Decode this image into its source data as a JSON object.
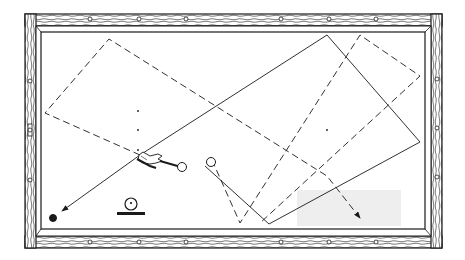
{
  "diagram": {
    "colors": {
      "ink": "#1a1a1a",
      "felt": "#ffffff",
      "rail_wood": "#ffffff",
      "shade": "#eeeeee"
    },
    "table": {
      "outer": {
        "x": 25,
        "y": 14,
        "w": 417,
        "h": 234
      },
      "inner": {
        "x": 41,
        "y": 32,
        "w": 384,
        "h": 197
      }
    },
    "rail_diamonds": {
      "top": [
        [
          90,
          19
        ],
        [
          139,
          19
        ],
        [
          186,
          19
        ],
        [
          281,
          19
        ],
        [
          329,
          19
        ],
        [
          376,
          19
        ]
      ],
      "bottom": [
        [
          90,
          242
        ],
        [
          139,
          242
        ],
        [
          186,
          242
        ],
        [
          281,
          242
        ],
        [
          329,
          242
        ],
        [
          376,
          242
        ]
      ],
      "left": [
        [
          30,
          81
        ],
        [
          30,
          130
        ],
        [
          30,
          180
        ]
      ],
      "right": [
        [
          437,
          79
        ],
        [
          437,
          128
        ],
        [
          437,
          177
        ]
      ]
    },
    "paths": [
      {
        "name": "dashed-path-1",
        "style": "dashed",
        "points": [
          [
            140,
            155
          ],
          [
            45,
            113
          ],
          [
            109,
            39
          ],
          [
            327,
            176
          ],
          [
            360,
            218
          ]
        ],
        "arrow_end": true
      },
      {
        "name": "dashed-path-2",
        "style": "dashed",
        "points": [
          [
            212,
            160
          ],
          [
            240,
            223
          ],
          [
            360,
            35
          ],
          [
            420,
            76
          ],
          [
            260,
            223
          ]
        ],
        "arrow_end": false
      },
      {
        "name": "solid-path",
        "style": "solid",
        "points": [
          [
            205,
            166
          ],
          [
            269,
            224
          ],
          [
            420,
            142
          ],
          [
            327,
            35
          ],
          [
            140,
            155
          ],
          [
            62,
            211
          ]
        ],
        "arrow_end": true
      }
    ],
    "cue_stick": {
      "points": [
        [
          160,
          161
        ],
        [
          181,
          167
        ]
      ]
    },
    "balls": [
      {
        "name": "cue-ball-start",
        "cx": 182,
        "cy": 167,
        "r": 4.5,
        "fill": "white"
      },
      {
        "name": "cue-ball-ghost",
        "cx": 211,
        "cy": 162,
        "r": 4.5,
        "fill": "white"
      },
      {
        "name": "object-ball",
        "cx": 53,
        "cy": 218,
        "r": 3.5,
        "fill": "black"
      }
    ],
    "aim_dots": [
      [
        138,
        111
      ],
      [
        138,
        130
      ],
      [
        138,
        150
      ],
      [
        327,
        130
      ]
    ],
    "spin_indicator": {
      "cx": 131,
      "cy": 204,
      "r": 6,
      "dot_dy": -1,
      "base": {
        "x": 117,
        "y": 212,
        "w": 28,
        "h": 3
      }
    },
    "shaded_region": {
      "x": 297,
      "y": 190,
      "w": 104,
      "h": 36
    }
  }
}
